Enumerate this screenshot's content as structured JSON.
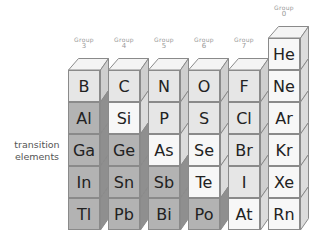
{
  "side_label": {
    "line1": "transition",
    "line2": "elements"
  },
  "groups": [
    {
      "word": "Group",
      "number": "3"
    },
    {
      "word": "Group",
      "number": "4"
    },
    {
      "word": "Group",
      "number": "5"
    },
    {
      "word": "Group",
      "number": "6"
    },
    {
      "word": "Group",
      "number": "7"
    },
    {
      "word": "Group",
      "number": "0"
    }
  ],
  "columns": [
    {
      "group": "3",
      "elements": [
        {
          "symbol": "B",
          "shade": "light"
        },
        {
          "symbol": "Al",
          "shade": "dark"
        },
        {
          "symbol": "Ga",
          "shade": "dark"
        },
        {
          "symbol": "In",
          "shade": "dark"
        },
        {
          "symbol": "Tl",
          "shade": "dark"
        }
      ]
    },
    {
      "group": "4",
      "elements": [
        {
          "symbol": "C",
          "shade": "light"
        },
        {
          "symbol": "Si",
          "shade": "vlight"
        },
        {
          "symbol": "Ge",
          "shade": "dark"
        },
        {
          "symbol": "Sn",
          "shade": "dark"
        },
        {
          "symbol": "Pb",
          "shade": "dark"
        }
      ]
    },
    {
      "group": "5",
      "elements": [
        {
          "symbol": "N",
          "shade": "light"
        },
        {
          "symbol": "P",
          "shade": "light"
        },
        {
          "symbol": "As",
          "shade": "vlight"
        },
        {
          "symbol": "Sb",
          "shade": "dark"
        },
        {
          "symbol": "Bi",
          "shade": "dark"
        }
      ]
    },
    {
      "group": "6",
      "elements": [
        {
          "symbol": "O",
          "shade": "light"
        },
        {
          "symbol": "S",
          "shade": "light"
        },
        {
          "symbol": "Se",
          "shade": "vlight"
        },
        {
          "symbol": "Te",
          "shade": "vlight"
        },
        {
          "symbol": "Po",
          "shade": "dark"
        }
      ]
    },
    {
      "group": "7",
      "elements": [
        {
          "symbol": "F",
          "shade": "light"
        },
        {
          "symbol": "Cl",
          "shade": "light"
        },
        {
          "symbol": "Br",
          "shade": "light"
        },
        {
          "symbol": "I",
          "shade": "light"
        },
        {
          "symbol": "At",
          "shade": "vlight"
        }
      ]
    },
    {
      "group": "0",
      "elements": [
        {
          "symbol": "He",
          "shade": "vlight"
        },
        {
          "symbol": "Ne",
          "shade": "vlight"
        },
        {
          "symbol": "Ar",
          "shade": "vlight"
        },
        {
          "symbol": "Kr",
          "shade": "vlight"
        },
        {
          "symbol": "Xe",
          "shade": "vlight"
        },
        {
          "symbol": "Rn",
          "shade": "vlight"
        }
      ]
    }
  ],
  "colors": {
    "very_light": "#f7f7f7",
    "light": "#e6e6e6",
    "dark": "#b3b3b3",
    "outline": "#8a8a8a"
  }
}
